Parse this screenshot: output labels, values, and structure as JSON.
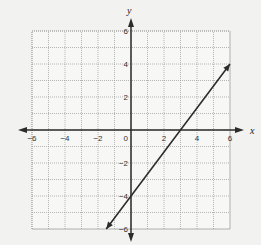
{
  "chart_data": {
    "type": "line",
    "title": "",
    "xlabel": "x",
    "ylabel": "y",
    "xlim": [
      -6,
      6
    ],
    "ylim": [
      -6,
      6
    ],
    "grid": true,
    "x_ticks": [
      "-6",
      "-4",
      "-2",
      "2",
      "4",
      "6"
    ],
    "y_ticks": [
      "6",
      "4",
      "2",
      "-2",
      "-4",
      "-6"
    ],
    "origin_label": "0",
    "series": [
      {
        "name": "line",
        "equation": "y = (4/3)x - 4",
        "x": [
          -1.5,
          0,
          3,
          6
        ],
        "y": [
          -6,
          -4,
          0,
          4
        ]
      }
    ],
    "colors": {
      "line": "#2b2b2b",
      "grid": "#9a9a9a",
      "background": "#f2f2f0"
    }
  }
}
